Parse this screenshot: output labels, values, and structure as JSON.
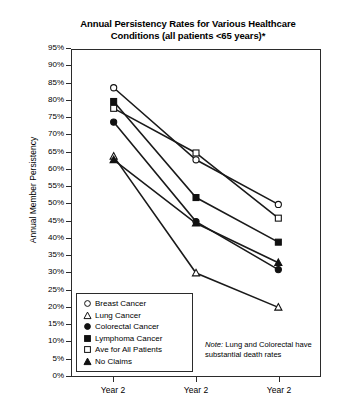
{
  "chart_data": {
    "type": "line",
    "title": "Annual Persistency Rates for Various Healthcare Conditions (all patients <65 years)*",
    "title_line1": "Annual Persistency Rates for Various Healthcare",
    "title_line2": "Conditions (all patients <65 years)*",
    "xlabel": "",
    "ylabel": "Annual Member Persistency",
    "ylim": [
      0,
      95
    ],
    "ytick_step": 5,
    "grid": false,
    "legend_position": "inside-bottom-left",
    "categories": [
      "Year 2",
      "Year 2",
      "Year 2"
    ],
    "ytick_labels": [
      "95%",
      "90%",
      "85%",
      "80%",
      "75%",
      "70%",
      "65%",
      "60%",
      "55%",
      "50%",
      "45%",
      "40%",
      "35%",
      "30%",
      "25%",
      "20%",
      "15%",
      "10%",
      "5%",
      "0%"
    ],
    "ytick_values": [
      95,
      90,
      85,
      80,
      75,
      70,
      65,
      60,
      55,
      50,
      45,
      40,
      35,
      30,
      25,
      20,
      15,
      10,
      5,
      0
    ],
    "series": [
      {
        "name": "Breast Cancer",
        "marker": "open-circle",
        "values": [
          84,
          63,
          50
        ]
      },
      {
        "name": "Lung Cancer",
        "marker": "open-triangle",
        "values": [
          64,
          30,
          20
        ]
      },
      {
        "name": "Colorectal Cancer",
        "marker": "filled-circle",
        "values": [
          74,
          45,
          31
        ]
      },
      {
        "name": "Lymphoma Cancer",
        "marker": "filled-square",
        "values": [
          80,
          52,
          39
        ]
      },
      {
        "name": "Ave for All Patients",
        "marker": "open-square",
        "values": [
          78,
          65,
          46
        ]
      },
      {
        "name": "No Claims",
        "marker": "filled-triangle",
        "values": [
          63,
          44.5,
          33
        ]
      }
    ],
    "annotations": [
      {
        "text": "Note: Lung and Colorectal have substantial death rates",
        "emphasis": "Note:"
      }
    ],
    "colors": {
      "line": "#1a1a1a",
      "frame": "#2b2b2b",
      "background": "#ffffff"
    }
  },
  "note": {
    "label": "Note:",
    "text": " Lung and Colorectal have substantial death rates"
  },
  "legend": {
    "items": [
      {
        "label": "Breast Cancer",
        "marker": "open-circle"
      },
      {
        "label": "Lung Cancer",
        "marker": "open-triangle"
      },
      {
        "label": "Colorectal Cancer",
        "marker": "filled-circle"
      },
      {
        "label": "Lymphoma Cancer",
        "marker": "filled-square"
      },
      {
        "label": "Ave for All Patients",
        "marker": "open-square"
      },
      {
        "label": "No Claims",
        "marker": "filled-triangle"
      }
    ]
  }
}
